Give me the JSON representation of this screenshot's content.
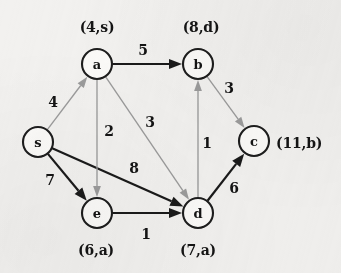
{
  "figure": {
    "background_color": "#f2f1ef",
    "dark_edge_color": "#1a1a1a",
    "light_edge_color": "#9b9b9b",
    "node_fill_color": "#fbfaf8",
    "node_stroke_color": "#1d1d1d"
  },
  "nodes": [
    {
      "id": "s",
      "label": "s",
      "cx": 38,
      "cy": 142,
      "r": 15,
      "annotation": "",
      "annot_x": 0,
      "annot_y": 0,
      "annot_anchor": "middle"
    },
    {
      "id": "a",
      "label": "a",
      "cx": 97,
      "cy": 64,
      "r": 15,
      "annotation": "(4,s)",
      "annot_x": 97,
      "annot_y": 27,
      "annot_anchor": "middle"
    },
    {
      "id": "b",
      "label": "b",
      "cx": 198,
      "cy": 64,
      "r": 15,
      "annotation": "(8,d)",
      "annot_x": 201,
      "annot_y": 27,
      "annot_anchor": "middle"
    },
    {
      "id": "c",
      "label": "c",
      "cx": 254,
      "cy": 141,
      "r": 15,
      "annotation": "(11,b)",
      "annot_x": 276,
      "annot_y": 143,
      "annot_anchor": "start"
    },
    {
      "id": "d",
      "label": "d",
      "cx": 198,
      "cy": 213,
      "r": 15,
      "annotation": "(7,a)",
      "annot_x": 198,
      "annot_y": 250,
      "annot_anchor": "middle"
    },
    {
      "id": "e",
      "label": "e",
      "cx": 97,
      "cy": 213,
      "r": 15,
      "annotation": "(6,a)",
      "annot_x": 96,
      "annot_y": 250,
      "annot_anchor": "middle"
    }
  ],
  "edges": [
    {
      "id": "s-a",
      "from": "s",
      "to": "a",
      "weight": "4",
      "style": "light",
      "wx": 53,
      "wy": 102
    },
    {
      "id": "s-e",
      "from": "s",
      "to": "e",
      "weight": "7",
      "style": "dark",
      "wx": 50,
      "wy": 180
    },
    {
      "id": "s-d",
      "from": "s",
      "to": "d",
      "weight": "8",
      "style": "dark",
      "wx": 134,
      "wy": 168
    },
    {
      "id": "a-b",
      "from": "a",
      "to": "b",
      "weight": "5",
      "style": "dark",
      "wx": 143,
      "wy": 50
    },
    {
      "id": "a-e",
      "from": "a",
      "to": "e",
      "weight": "2",
      "style": "light",
      "wx": 109,
      "wy": 131
    },
    {
      "id": "a-d",
      "from": "a",
      "to": "d",
      "weight": "3",
      "style": "light",
      "wx": 150,
      "wy": 122
    },
    {
      "id": "b-c",
      "from": "b",
      "to": "c",
      "weight": "3",
      "style": "light",
      "wx": 229,
      "wy": 88
    },
    {
      "id": "d-b",
      "from": "d",
      "to": "b",
      "weight": "1",
      "style": "light",
      "wx": 207,
      "wy": 143
    },
    {
      "id": "d-c",
      "from": "d",
      "to": "c",
      "weight": "6",
      "style": "dark",
      "wx": 234,
      "wy": 188
    },
    {
      "id": "e-d",
      "from": "e",
      "to": "d",
      "weight": "1",
      "style": "dark",
      "wx": 146,
      "wy": 234
    }
  ]
}
